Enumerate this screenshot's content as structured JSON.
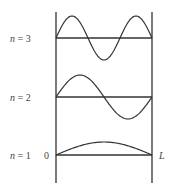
{
  "diagram": {
    "wall_left_label": "0",
    "wall_right_label": "L",
    "modes": [
      {
        "n": 3,
        "label_var": "n",
        "label_eq": " = 3",
        "baseline_y": 38,
        "amplitude": 22
      },
      {
        "n": 2,
        "label_var": "n",
        "label_eq": " = 2",
        "baseline_y": 97,
        "amplitude": 22
      },
      {
        "n": 1,
        "label_var": "n",
        "label_eq": " = 1",
        "baseline_y": 155,
        "amplitude": 13
      }
    ],
    "colors": {
      "line": "#333333",
      "text": "#444444",
      "background": "#ffffff"
    }
  }
}
